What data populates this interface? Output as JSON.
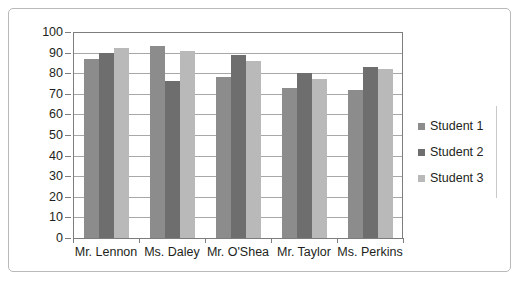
{
  "chart_data": {
    "type": "bar",
    "title": "",
    "xlabel": "",
    "ylabel": "",
    "ylim": [
      0,
      100
    ],
    "ytick_step": 10,
    "yticks": [
      "100",
      "90",
      "80",
      "70",
      "60",
      "50",
      "40",
      "30",
      "20",
      "10",
      "0"
    ],
    "grid": true,
    "legend_position": "right",
    "categories": [
      "Mr. Lennon",
      "Ms. Daley",
      "Mr. O'Shea",
      "Mr. Taylor",
      "Ms. Perkins"
    ],
    "series": [
      {
        "name": "Student 1",
        "color": "#8c8c8c",
        "values": [
          87,
          93,
          78,
          73,
          72
        ]
      },
      {
        "name": "Student 2",
        "color": "#6e6e6e",
        "values": [
          90,
          76,
          89,
          80,
          83
        ]
      },
      {
        "name": "Student 3",
        "color": "#b9b9b9",
        "values": [
          92,
          91,
          86,
          77,
          82
        ]
      }
    ]
  }
}
